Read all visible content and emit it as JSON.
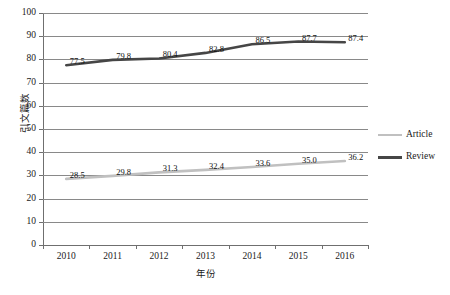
{
  "chart_data": {
    "type": "line",
    "title": "",
    "subtitle": "",
    "xlabel": "年份",
    "ylabel": "引文篇数",
    "categories": [
      "2010",
      "2011",
      "2012",
      "2013",
      "2014",
      "2015",
      "2016"
    ],
    "series": [
      {
        "name": "Article",
        "color": "#c0c0c0",
        "values": [
          28.5,
          29.8,
          31.3,
          32.4,
          33.6,
          35.0,
          36.2
        ],
        "labels": [
          "28.5",
          "29.8",
          "31.3",
          "32.4",
          "33.6",
          "35.0",
          "36.2"
        ]
      },
      {
        "name": "Review",
        "color": "#464646",
        "values": [
          77.5,
          79.8,
          80.4,
          82.8,
          86.5,
          87.7,
          87.4
        ],
        "labels": [
          "77.5",
          "79.8",
          "80.4",
          "82.8",
          "86.5",
          "87.7",
          "87.4"
        ]
      }
    ],
    "ylim": [
      0,
      100
    ],
    "y_ticks": [
      0,
      10,
      20,
      30,
      40,
      50,
      60,
      70,
      80,
      90,
      100
    ],
    "y_tick_labels": [
      "0",
      "10",
      "20",
      "30",
      "40",
      "50",
      "60",
      "70",
      "80",
      "90",
      "100"
    ],
    "grid": "horizontal",
    "legend_position": "right",
    "data_labels_shown": true
  },
  "legend": {
    "entries": [
      {
        "label": "Article",
        "color": "#c0c0c0"
      },
      {
        "label": "Review",
        "color": "#464646"
      }
    ]
  },
  "axes": {
    "y_title": "引文篇数",
    "x_title": "年份"
  }
}
